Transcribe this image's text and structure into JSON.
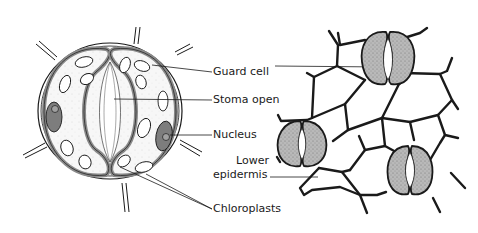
{
  "diagram": {
    "colors": {
      "ink": "#1a1a1a",
      "cell_fill": "#f4f4f4",
      "guard_wall": "#8a8a8a",
      "nucleus_fill": "#7d7d7d",
      "stipple_fill": "#b5b5b5",
      "background": "#ffffff"
    },
    "labels": {
      "guard_cell": "Guard cell",
      "stoma_open": "Stoma open",
      "nucleus": "Nucleus",
      "lower_epidermis_line1": "Lower",
      "lower_epidermis_line2": "epidermis",
      "chloroplasts": "Chloroplasts"
    },
    "panels": [
      {
        "name": "stoma-detail",
        "description": "Close-up of an open stoma with two guard cells"
      },
      {
        "name": "lower-epidermis-surface",
        "description": "Lower epidermis showing three stomata among irregular epidermal cells"
      }
    ]
  }
}
